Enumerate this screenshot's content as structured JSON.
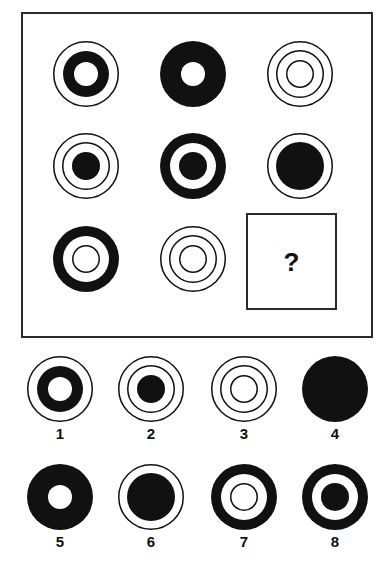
{
  "colors": {
    "ink": "#111111",
    "paper": "#ffffff",
    "frame": "#2a2a2a"
  },
  "puzzle": {
    "question_mark": "?",
    "grid": [
      {
        "id": "r1c1",
        "cx": 86,
        "cy": 74,
        "layers": [
          {
            "r": 33,
            "type": "outline"
          },
          {
            "r": 23,
            "type": "fill"
          },
          {
            "r": 12,
            "type": "hole"
          }
        ]
      },
      {
        "id": "r1c2",
        "cx": 193,
        "cy": 74,
        "layers": [
          {
            "r": 33,
            "type": "fill"
          },
          {
            "r": 12,
            "type": "hole"
          }
        ]
      },
      {
        "id": "r1c3",
        "cx": 300,
        "cy": 74,
        "layers": [
          {
            "r": 33,
            "type": "outline"
          },
          {
            "r": 24,
            "type": "outline"
          },
          {
            "r": 14,
            "type": "outline"
          }
        ]
      },
      {
        "id": "r2c1",
        "cx": 86,
        "cy": 166,
        "layers": [
          {
            "r": 33,
            "type": "outline"
          },
          {
            "r": 24,
            "type": "outline"
          },
          {
            "r": 14,
            "type": "fill"
          }
        ]
      },
      {
        "id": "r2c2",
        "cx": 193,
        "cy": 166,
        "layers": [
          {
            "r": 33,
            "type": "fill"
          },
          {
            "r": 23,
            "type": "hole"
          },
          {
            "r": 14,
            "type": "fill"
          }
        ]
      },
      {
        "id": "r2c3",
        "cx": 300,
        "cy": 166,
        "layers": [
          {
            "r": 33,
            "type": "outline"
          },
          {
            "r": 24,
            "type": "fill"
          }
        ]
      },
      {
        "id": "r3c1",
        "cx": 86,
        "cy": 259,
        "layers": [
          {
            "r": 33,
            "type": "fill"
          },
          {
            "r": 23,
            "type": "hole"
          },
          {
            "r": 14,
            "type": "outline"
          }
        ]
      },
      {
        "id": "r3c2",
        "cx": 193,
        "cy": 259,
        "layers": [
          {
            "r": 33,
            "type": "outline"
          },
          {
            "r": 24,
            "type": "outline"
          },
          {
            "r": 14,
            "type": "outline"
          }
        ]
      }
    ]
  },
  "options": [
    {
      "label": "1",
      "cx": 60,
      "cy": 389,
      "layers": [
        {
          "r": 33,
          "type": "outline"
        },
        {
          "r": 23,
          "type": "fill"
        },
        {
          "r": 12,
          "type": "hole"
        }
      ]
    },
    {
      "label": "2",
      "cx": 151,
      "cy": 389,
      "layers": [
        {
          "r": 33,
          "type": "outline"
        },
        {
          "r": 24,
          "type": "outline"
        },
        {
          "r": 14,
          "type": "fill"
        }
      ]
    },
    {
      "label": "3",
      "cx": 244,
      "cy": 389,
      "layers": [
        {
          "r": 33,
          "type": "outline"
        },
        {
          "r": 24,
          "type": "outline"
        },
        {
          "r": 14,
          "type": "outline"
        }
      ]
    },
    {
      "label": "4",
      "cx": 335,
      "cy": 389,
      "layers": [
        {
          "r": 33,
          "type": "fill"
        }
      ]
    },
    {
      "label": "5",
      "cx": 60,
      "cy": 497,
      "layers": [
        {
          "r": 33,
          "type": "fill"
        },
        {
          "r": 12,
          "type": "hole"
        }
      ]
    },
    {
      "label": "6",
      "cx": 151,
      "cy": 497,
      "layers": [
        {
          "r": 33,
          "type": "outline"
        },
        {
          "r": 24,
          "type": "fill"
        }
      ]
    },
    {
      "label": "7",
      "cx": 244,
      "cy": 497,
      "layers": [
        {
          "r": 33,
          "type": "fill"
        },
        {
          "r": 23,
          "type": "hole"
        },
        {
          "r": 14,
          "type": "outline"
        }
      ]
    },
    {
      "label": "8",
      "cx": 335,
      "cy": 497,
      "layers": [
        {
          "r": 33,
          "type": "fill"
        },
        {
          "r": 23,
          "type": "hole"
        },
        {
          "r": 14,
          "type": "fill"
        }
      ]
    }
  ]
}
